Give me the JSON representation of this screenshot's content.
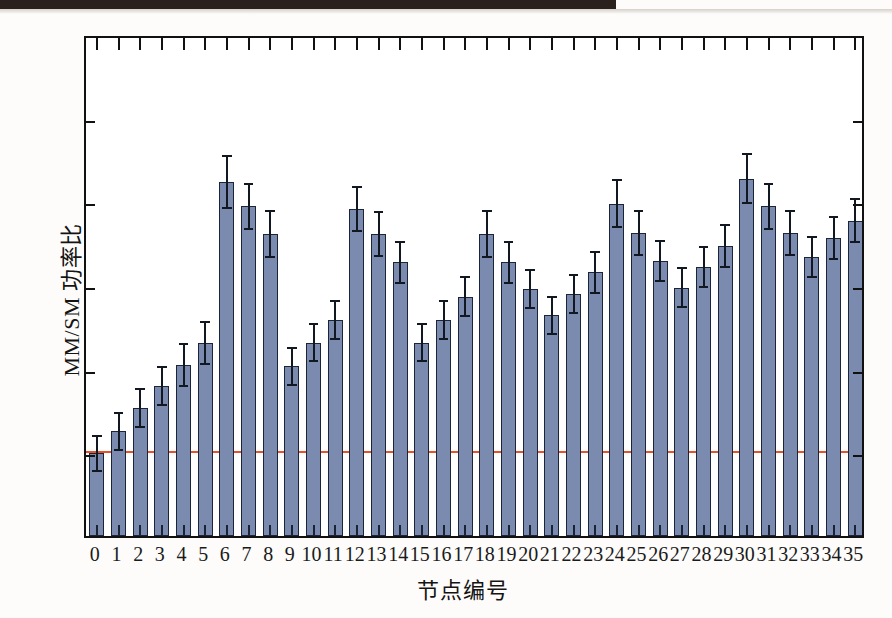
{
  "chart_data": {
    "type": "bar",
    "title": "",
    "xlabel": "节点编号",
    "ylabel": "MM/SM 功率比",
    "ylim": [
      0.9,
      1.5
    ],
    "ytick_labels": [
      "0.9",
      "1.0",
      "1.1",
      "1.2",
      "1.3",
      "1.4",
      "1.5"
    ],
    "ytick_values": [
      0.9,
      1.0,
      1.1,
      1.2,
      1.3,
      1.4,
      1.5
    ],
    "grid": false,
    "legend": "none",
    "reference_line": {
      "value": 1.0,
      "color": "#e8502a",
      "label": ""
    },
    "bar_color": "#7b8bb0",
    "bar_edge_color": "#1c2438",
    "error_bar_color": "#121821",
    "categories": [
      "0",
      "1",
      "2",
      "3",
      "4",
      "5",
      "6",
      "7",
      "8",
      "9",
      "10",
      "11",
      "12",
      "13",
      "14",
      "15",
      "16",
      "17",
      "18",
      "19",
      "20",
      "21",
      "22",
      "23",
      "24",
      "25",
      "26",
      "27",
      "28",
      "29",
      "30",
      "31",
      "32",
      "33",
      "34",
      "35"
    ],
    "values": [
      0.999,
      1.025,
      1.053,
      1.079,
      1.104,
      1.131,
      1.323,
      1.294,
      1.261,
      1.103,
      1.131,
      1.158,
      1.291,
      1.261,
      1.227,
      1.131,
      1.158,
      1.186,
      1.261,
      1.227,
      1.195,
      1.164,
      1.189,
      1.215,
      1.297,
      1.262,
      1.229,
      1.197,
      1.222,
      1.247,
      1.327,
      1.294,
      1.262,
      1.233,
      1.256,
      1.277
    ],
    "errors": [
      0.021,
      0.022,
      0.023,
      0.023,
      0.025,
      0.025,
      0.031,
      0.027,
      0.027,
      0.022,
      0.022,
      0.023,
      0.026,
      0.026,
      0.024,
      0.022,
      0.023,
      0.023,
      0.027,
      0.024,
      0.023,
      0.022,
      0.023,
      0.024,
      0.028,
      0.026,
      0.024,
      0.023,
      0.024,
      0.025,
      0.029,
      0.027,
      0.026,
      0.024,
      0.025,
      0.026
    ]
  },
  "axes": {
    "x_axis_name": "node-number-axis",
    "y_axis_name": "power-ratio-axis"
  }
}
